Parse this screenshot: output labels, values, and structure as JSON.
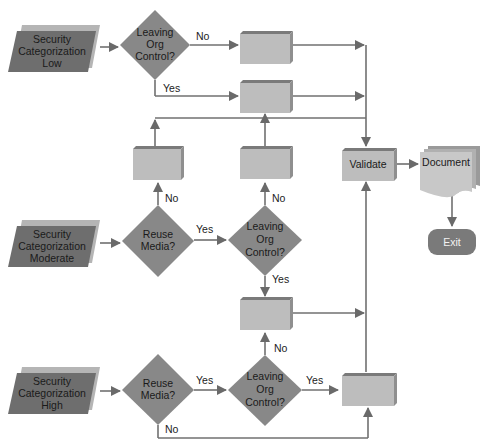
{
  "diagram": {
    "colors": {
      "line": "#707070",
      "diamond": "#888888",
      "parallelogram_face": "#6e6e6e",
      "parallelogram_shadow": "#b5b5b5",
      "box_face": "#bdbdbd",
      "box_top": "#7a7a7a",
      "box_side": "#8f8f8f",
      "exit": "#7a7a7a",
      "document": "#c8c8c8"
    },
    "inputs": {
      "low": {
        "line1": "Security",
        "line2": "Categorization",
        "line3": "Low"
      },
      "moderate": {
        "line1": "Security",
        "line2": "Categorization",
        "line3": "Moderate"
      },
      "high": {
        "line1": "Security",
        "line2": "Categorization",
        "line3": "High"
      }
    },
    "decisions": {
      "low_leaving": {
        "line1": "Leaving",
        "line2": "Org",
        "line3": "Control?"
      },
      "mod_reuse": {
        "line1": "Reuse",
        "line2": "Media?"
      },
      "mod_leaving": {
        "line1": "Leaving",
        "line2": "Org",
        "line3": "Control?"
      },
      "high_reuse": {
        "line1": "Reuse",
        "line2": "Media?"
      },
      "high_leaving": {
        "line1": "Leaving",
        "line2": "Org",
        "line3": "Control?"
      }
    },
    "edge_labels": {
      "low_no": "No",
      "low_yes": "Yes",
      "mod_reuse_no": "No",
      "mod_reuse_yes": "Yes",
      "mod_leaving_no": "No",
      "mod_leaving_yes": "Yes",
      "box5_no": "No",
      "high_reuse_yes": "Yes",
      "high_leaving_yes": "Yes",
      "high_reuse_no": "No"
    },
    "process": {
      "validate": "Validate",
      "document": "Document",
      "exit": "Exit"
    }
  }
}
